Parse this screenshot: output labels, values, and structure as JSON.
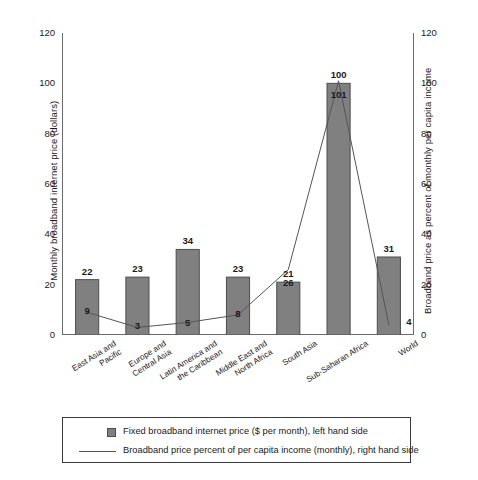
{
  "chart_data": {
    "type": "bar",
    "title": "",
    "subtitle": "",
    "categories": [
      "East Asia and Pacific",
      "Europe and Central Asia",
      "Latin America and the Caribbean",
      "Middle East and North Africa",
      "South Asia",
      "Sub-Saharan Africa",
      "World"
    ],
    "category_lines": [
      [
        "East Asia and",
        "Pacific"
      ],
      [
        "Europe and",
        "Central Asia"
      ],
      [
        "Latin America and",
        "the Caribbean"
      ],
      [
        "Middle East and",
        "North Africa"
      ],
      [
        "South Asia"
      ],
      [
        "Sub-Saharan Africa"
      ],
      [
        "World"
      ]
    ],
    "series": [
      {
        "name": "Fixed broadband internet price ($ per month), left hand side",
        "type": "bar",
        "axis": "left",
        "color": "#808080",
        "values": [
          22,
          23,
          34,
          23,
          21,
          100,
          31
        ]
      },
      {
        "name": "Broadband price percent of per capita income (monthly), right hand side",
        "type": "line",
        "axis": "right",
        "color": "#555555",
        "values": [
          9,
          3,
          5,
          8,
          26,
          101,
          4
        ]
      }
    ],
    "xlabel": "",
    "ylabel": "Monthly broadband internet price (dollars)",
    "ylabel_right": "Broadband price as percent of monthly per capita income",
    "ylim": [
      0,
      120
    ],
    "ylim_right": [
      0,
      120
    ],
    "yticks": [
      0,
      20,
      40,
      60,
      80,
      100,
      120
    ],
    "yticks_right": [
      0,
      20,
      40,
      60,
      80,
      100,
      120
    ],
    "grid": false,
    "legend_position": "bottom"
  },
  "axes": {
    "left_title": "Monthly broadband internet price (dollars)",
    "right_title": "Broadband price as percent of monthly per capita income"
  },
  "legend": {
    "bar_label": "Fixed broadband internet price ($ per month), left hand side",
    "line_label": "Broadband price percent of per capita income (monthly), right hand side"
  }
}
